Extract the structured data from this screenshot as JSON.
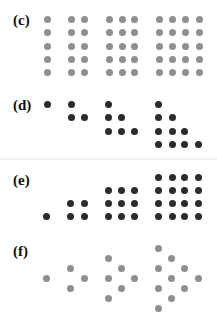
{
  "colors": {
    "gray": "#8f8f8f",
    "dark": "#2b2b2b"
  },
  "panels": [
    {
      "id": "c",
      "label": "(c)",
      "label_top": 12,
      "color": "gray",
      "description": "Columns of 5 dots: 1, 2, 3, 4 columns",
      "dots": [
        [
          47,
          19
        ],
        [
          47,
          32
        ],
        [
          47,
          46
        ],
        [
          47,
          59
        ],
        [
          47,
          72
        ],
        [
          71,
          19
        ],
        [
          71,
          32
        ],
        [
          71,
          46
        ],
        [
          71,
          59
        ],
        [
          71,
          72
        ],
        [
          84,
          19
        ],
        [
          84,
          32
        ],
        [
          84,
          46
        ],
        [
          84,
          59
        ],
        [
          84,
          72
        ],
        [
          109,
          19
        ],
        [
          109,
          32
        ],
        [
          109,
          46
        ],
        [
          109,
          59
        ],
        [
          109,
          72
        ],
        [
          122,
          19
        ],
        [
          122,
          32
        ],
        [
          122,
          46
        ],
        [
          122,
          59
        ],
        [
          122,
          72
        ],
        [
          134,
          19
        ],
        [
          134,
          32
        ],
        [
          134,
          46
        ],
        [
          134,
          59
        ],
        [
          134,
          72
        ],
        [
          159,
          19
        ],
        [
          159,
          32
        ],
        [
          159,
          46
        ],
        [
          159,
          59
        ],
        [
          159,
          72
        ],
        [
          172,
          19
        ],
        [
          172,
          32
        ],
        [
          172,
          46
        ],
        [
          172,
          59
        ],
        [
          172,
          72
        ],
        [
          185,
          19
        ],
        [
          185,
          32
        ],
        [
          185,
          46
        ],
        [
          185,
          59
        ],
        [
          185,
          72
        ],
        [
          199,
          19
        ],
        [
          199,
          32
        ],
        [
          199,
          46
        ],
        [
          199,
          59
        ],
        [
          199,
          72
        ]
      ]
    },
    {
      "id": "d",
      "label": "(d)",
      "label_top": 97,
      "color": "dark",
      "description": "Triangular numbers 1, 3, 6, 10 (left-aligned)",
      "dots": [
        [
          47,
          104
        ],
        [
          71,
          104
        ],
        [
          71,
          117
        ],
        [
          84,
          117
        ],
        [
          108,
          104
        ],
        [
          108,
          117
        ],
        [
          121,
          117
        ],
        [
          108,
          131
        ],
        [
          121,
          131
        ],
        [
          134,
          131
        ],
        [
          158,
          104
        ],
        [
          158,
          117
        ],
        [
          172,
          117
        ],
        [
          158,
          131
        ],
        [
          172,
          131
        ],
        [
          184,
          131
        ],
        [
          158,
          144
        ],
        [
          172,
          144
        ],
        [
          184,
          144
        ],
        [
          198,
          144
        ]
      ]
    },
    {
      "id": "e",
      "label": "(e)",
      "label_top": 172,
      "color": "dark",
      "description": "Square numbers 1, 4, 9, 16 (bottom-aligned)",
      "dots": [
        [
          46,
          216
        ],
        [
          70,
          203
        ],
        [
          84,
          203
        ],
        [
          70,
          216
        ],
        [
          84,
          216
        ],
        [
          108,
          190
        ],
        [
          121,
          190
        ],
        [
          134,
          190
        ],
        [
          108,
          203
        ],
        [
          121,
          203
        ],
        [
          134,
          203
        ],
        [
          108,
          216
        ],
        [
          121,
          216
        ],
        [
          134,
          216
        ],
        [
          158,
          177
        ],
        [
          172,
          177
        ],
        [
          184,
          177
        ],
        [
          198,
          177
        ],
        [
          158,
          190
        ],
        [
          172,
          190
        ],
        [
          184,
          190
        ],
        [
          198,
          190
        ],
        [
          158,
          203
        ],
        [
          172,
          203
        ],
        [
          184,
          203
        ],
        [
          198,
          203
        ],
        [
          158,
          216
        ],
        [
          172,
          216
        ],
        [
          184,
          216
        ],
        [
          198,
          216
        ]
      ]
    },
    {
      "id": "f",
      "label": "(f)",
      "label_top": 243,
      "color": "gray",
      "description": "Triangular numbers 1, 3, 6, 10 in rotated triangle arrangement",
      "dots": [
        [
          46,
          278
        ],
        [
          70,
          268
        ],
        [
          70,
          288
        ],
        [
          84,
          278
        ],
        [
          108,
          258
        ],
        [
          108,
          278
        ],
        [
          108,
          298
        ],
        [
          121,
          268
        ],
        [
          121,
          288
        ],
        [
          134,
          278
        ],
        [
          158,
          248
        ],
        [
          158,
          268
        ],
        [
          158,
          288
        ],
        [
          158,
          308
        ],
        [
          171,
          258
        ],
        [
          171,
          278
        ],
        [
          171,
          298
        ],
        [
          184,
          268
        ],
        [
          184,
          288
        ],
        [
          198,
          278
        ]
      ]
    }
  ]
}
